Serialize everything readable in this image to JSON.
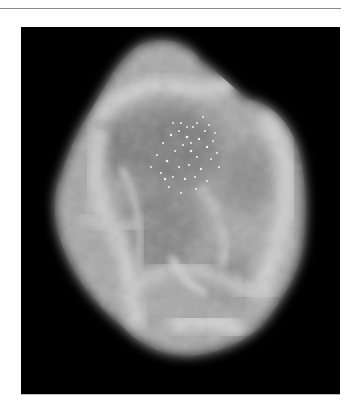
{
  "figure": {
    "colors": {
      "background": "#ffffff",
      "panel": "#000000",
      "rule": "#8a8a8a",
      "tissue_light": "#d8d8d8",
      "tissue_mid": "#9a9a9a",
      "tissue_dark": "#6e6e6e"
    }
  }
}
